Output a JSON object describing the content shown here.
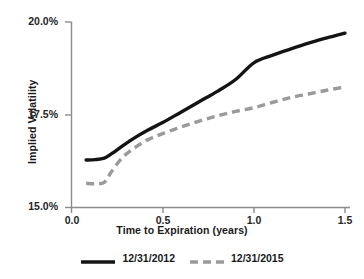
{
  "chart_data": {
    "type": "line",
    "title": "",
    "xlabel": "Time to Expiration (years)",
    "ylabel": "Implied Volatility",
    "xlim": [
      0.0,
      1.5
    ],
    "ylim": [
      15.0,
      20.0
    ],
    "grid": false,
    "legend_position": "bottom",
    "xticks": [
      "0.0",
      "0.5",
      "1.0",
      "1.5"
    ],
    "xtick_values": [
      0.0,
      0.5,
      1.0,
      1.5
    ],
    "yticks": [
      "15.0%",
      "17.5%",
      "20.0%"
    ],
    "ytick_values": [
      15.0,
      17.5,
      20.0
    ],
    "series": [
      {
        "name": "12/31/2012",
        "style": "solid",
        "color": "#141414",
        "x": [
          0.08,
          0.13,
          0.18,
          0.22,
          0.28,
          0.35,
          0.42,
          0.5,
          0.6,
          0.7,
          0.8,
          0.9,
          1.0,
          1.1,
          1.2,
          1.3,
          1.4,
          1.5
        ],
        "values": [
          16.28,
          16.29,
          16.33,
          16.45,
          16.66,
          16.89,
          17.09,
          17.29,
          17.57,
          17.85,
          18.13,
          18.45,
          18.9,
          19.1,
          19.27,
          19.43,
          19.57,
          19.7
        ]
      },
      {
        "name": "12/31/2015",
        "style": "dashed",
        "color": "#9a9a9a",
        "x": [
          0.08,
          0.13,
          0.18,
          0.22,
          0.28,
          0.35,
          0.42,
          0.5,
          0.6,
          0.7,
          0.8,
          0.9,
          1.0,
          1.1,
          1.2,
          1.3,
          1.4,
          1.5
        ],
        "values": [
          15.65,
          15.64,
          15.68,
          15.97,
          16.35,
          16.62,
          16.83,
          16.99,
          17.17,
          17.33,
          17.47,
          17.59,
          17.69,
          17.83,
          17.96,
          18.06,
          18.16,
          18.25
        ]
      }
    ]
  },
  "legend": {
    "entries": [
      {
        "label": "12/31/2012"
      },
      {
        "label": "12/31/2015"
      }
    ]
  }
}
